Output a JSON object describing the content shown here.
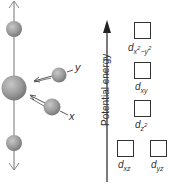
{
  "molecule_diagram": {
    "axis_labels": {
      "y": "y",
      "x": "x"
    },
    "colors": {
      "sphere": "#9a9a9a",
      "axis_line": "#8a8a8a",
      "arrow": "#555555"
    }
  },
  "energy_diagram": {
    "y_axis_label": "Potential energy",
    "orbitals": [
      {
        "id": "dx2-y2",
        "base": "d",
        "sub": "x",
        "sup": "2",
        "sub2": "−y",
        "sup2": "2"
      },
      {
        "id": "dxy",
        "base": "d",
        "sub": "xy"
      },
      {
        "id": "dz2",
        "base": "d",
        "sub": "z",
        "sup": "2"
      },
      {
        "id": "dxz",
        "base": "d",
        "sub": "xz"
      },
      {
        "id": "dyz",
        "base": "d",
        "sub": "yz"
      }
    ]
  }
}
